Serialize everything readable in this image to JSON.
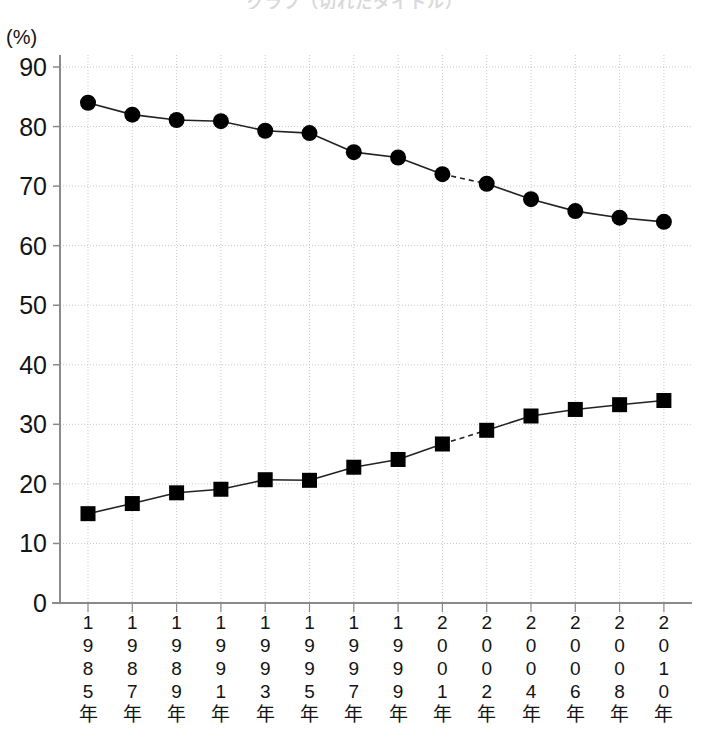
{
  "title": "グラフ（切れたタイトル）",
  "axis": {
    "y_unit_label": "(%)",
    "y_ticks": [
      0,
      10,
      20,
      30,
      40,
      50,
      60,
      70,
      80,
      90
    ],
    "x_tick_labels": [
      "1985年",
      "1987年",
      "1989年",
      "1991年",
      "1993年",
      "1995年",
      "1997年",
      "1999年",
      "2001年",
      "2002年",
      "2004年",
      "2006年",
      "2008年",
      "2010年"
    ]
  },
  "colors": {
    "line": "#222222",
    "marker": "#000000",
    "grid": "#c9c9c9",
    "axis": "#8a8a8a",
    "background": "#ffffff"
  },
  "chart_data": {
    "type": "line",
    "title": "",
    "xlabel": "",
    "ylabel": "(%)",
    "ylim": [
      0,
      90
    ],
    "grid": true,
    "legend": "none",
    "categories": [
      "1985年",
      "1987年",
      "1989年",
      "1991年",
      "1993年",
      "1995年",
      "1997年",
      "1999年",
      "2001年",
      "2002年",
      "2004年",
      "2006年",
      "2008年",
      "2010年"
    ],
    "x_numeric": [
      1985,
      1987,
      1989,
      1991,
      1993,
      1995,
      1997,
      1999,
      2001,
      2002,
      2004,
      2006,
      2008,
      2010
    ],
    "series": [
      {
        "name": "上の系列（丸印）",
        "marker": "circle",
        "values": [
          84.0,
          82.0,
          81.1,
          80.9,
          79.3,
          78.9,
          75.7,
          74.8,
          72.0,
          70.4,
          67.8,
          65.8,
          64.7,
          64.0
        ],
        "dashed_segments": [
          [
            8,
            9
          ]
        ]
      },
      {
        "name": "下の系列（四角印）",
        "marker": "square",
        "values": [
          15.0,
          16.7,
          18.5,
          19.1,
          20.7,
          20.6,
          22.8,
          24.1,
          26.7,
          29.0,
          31.4,
          32.5,
          33.3,
          34.0
        ],
        "dashed_segments": [
          [
            8,
            9
          ]
        ]
      }
    ]
  }
}
